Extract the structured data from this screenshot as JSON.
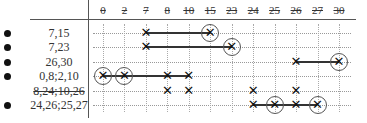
{
  "columns": [
    "0",
    "2",
    "7",
    "8",
    "10",
    "15",
    "23",
    "24",
    "25",
    "26",
    "27",
    "30"
  ],
  "rows": [
    {
      "label": "7,15",
      "bullet": true,
      "struck": false
    },
    {
      "label": "7,23",
      "bullet": true,
      "struck": false
    },
    {
      "label": "26,30",
      "bullet": true,
      "struck": false
    },
    {
      "label": "0,8;2,10",
      "bullet": true,
      "struck": false
    },
    {
      "label": "8,24;10,26",
      "bullet": false,
      "struck": true
    },
    {
      "label": "24,26;25,27",
      "bullet": true,
      "struck": false
    }
  ],
  "marks": [
    {
      "row": 0,
      "cols": [
        2,
        5
      ],
      "circled": [
        5
      ],
      "segments": [
        [
          2,
          5
        ]
      ]
    },
    {
      "row": 1,
      "cols": [
        2,
        6
      ],
      "circled": [
        6
      ],
      "segments": [
        [
          2,
          6
        ]
      ]
    },
    {
      "row": 2,
      "cols": [
        9,
        11
      ],
      "circled": [
        11
      ],
      "segments": [
        [
          9,
          11
        ]
      ]
    },
    {
      "row": 3,
      "cols": [
        0,
        1,
        3,
        4
      ],
      "circled": [
        0,
        1
      ],
      "segments": [
        [
          0,
          4
        ]
      ]
    },
    {
      "row": 4,
      "cols": [
        3,
        4,
        7,
        9
      ],
      "circled": [],
      "segments": []
    },
    {
      "row": 5,
      "cols": [
        7,
        8,
        9,
        10
      ],
      "circled": [
        8,
        10
      ],
      "segments": [
        [
          7,
          10
        ]
      ]
    }
  ]
}
